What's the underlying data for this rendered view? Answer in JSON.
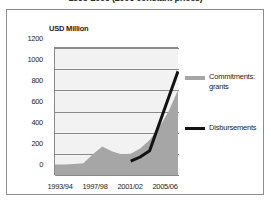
{
  "title": "1993-2006 (2006 constant prices)",
  "axis_unit_label": "USD Million",
  "legend": {
    "items": [
      {
        "label_line1": "Commitments:",
        "label_line2": "grants",
        "color": "#a6a6a6",
        "style": "area"
      },
      {
        "label_line1": "Disbursements",
        "label_line2": "",
        "color": "#121212",
        "style": "line"
      }
    ]
  },
  "yticks": [
    "1200",
    "1000",
    "800",
    "600",
    "400",
    "200",
    "0"
  ],
  "xticks": [
    "1993/94",
    "1997/98",
    "2001/02",
    "2005/06"
  ],
  "colors": {
    "area_fill": "#a6a6a6",
    "line": "#121212",
    "plot_background": "#f2f2f2",
    "gridline": "#8a8a8a",
    "frame": "#8d8d8d",
    "text": "#1d1d1d"
  },
  "chart_data": {
    "type": "area",
    "title": "1993-2006 (2006 constant prices)",
    "xlabel": "",
    "ylabel": "USD Million",
    "ylim": [
      0,
      1200
    ],
    "ytick_values": [
      0,
      200,
      400,
      600,
      800,
      1000,
      1200
    ],
    "grid": true,
    "legend_position": "right",
    "categories": [
      "1993/94",
      "1994/95",
      "1995/96",
      "1996/97",
      "1997/98",
      "1998/99",
      "1999/00",
      "2000/01",
      "2001/02",
      "2002/03",
      "2003/04",
      "2004/05",
      "2005/06",
      "2006/07"
    ],
    "xtick_labels": [
      "1993/94",
      "1997/98",
      "2001/02",
      "2005/06"
    ],
    "series": [
      {
        "name": "Commitments: grants",
        "type": "area",
        "color": "#a6a6a6",
        "values": [
          100,
          100,
          105,
          110,
          195,
          270,
          225,
          195,
          200,
          250,
          330,
          450,
          600,
          800
        ]
      },
      {
        "name": "Disbursements",
        "type": "line",
        "color": "#121212",
        "start_category": "2001/02",
        "values": [
          null,
          null,
          null,
          null,
          null,
          null,
          null,
          null,
          130,
          170,
          230,
          480,
          730,
          980
        ]
      }
    ],
    "annotations": []
  }
}
